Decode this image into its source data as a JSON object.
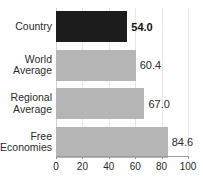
{
  "chart_data": {
    "type": "bar",
    "orientation": "horizontal",
    "title": "",
    "xlabel": "",
    "ylabel": "",
    "xlim": [
      0,
      100
    ],
    "xticks": [
      0,
      20,
      40,
      60,
      80,
      100
    ],
    "xtick_labels": [
      "0",
      "20",
      "40",
      "60",
      "80",
      "100"
    ],
    "grid": true,
    "grid_axis": "x",
    "legend": false,
    "categories": [
      "Country",
      "World Average",
      "Regional Average",
      "Free Economies"
    ],
    "values": [
      54.0,
      60.4,
      67.0,
      84.6
    ],
    "value_labels": [
      "54.0",
      "60.4",
      "67.0",
      "84.6"
    ],
    "bars": [
      {
        "category": "Country",
        "category_line1": "Country",
        "category_line2": "",
        "value": 54.0,
        "value_label": "54.0",
        "color": "#1c1c1c",
        "emphasis": true
      },
      {
        "category": "World Average",
        "category_line1": "World",
        "category_line2": "Average",
        "value": 60.4,
        "value_label": "60.4",
        "color": "#b5b5b5",
        "emphasis": false
      },
      {
        "category": "Regional Average",
        "category_line1": "Regional",
        "category_line2": "Average",
        "value": 67.0,
        "value_label": "67.0",
        "color": "#b5b5b5",
        "emphasis": false
      },
      {
        "category": "Free Economies",
        "category_line1": "Free",
        "category_line2": "Economies",
        "value": 84.6,
        "value_label": "84.6",
        "color": "#b5b5b5",
        "emphasis": false
      }
    ],
    "colors": {
      "highlight_bar": "#1c1c1c",
      "default_bar": "#b5b5b5",
      "gridline": "#e6e6e6",
      "axis": "#9a9a9a",
      "text": "#2b2b2b",
      "background": "#ffffff"
    }
  }
}
